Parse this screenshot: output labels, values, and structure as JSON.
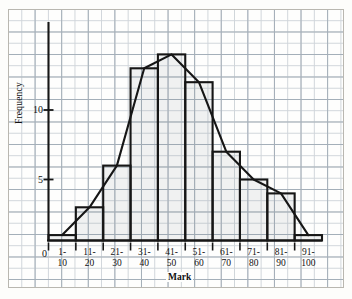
{
  "chart_data": {
    "type": "bar",
    "title": "",
    "subtitle": "",
    "xlabel": "Mark",
    "ylabel": "Frequency",
    "categories": [
      "1-\n10",
      "11-\n20",
      "21-\n30",
      "31-\n40",
      "41-\n50",
      "51-\n60",
      "61-\n70",
      "71-\n80",
      "81-\n90",
      "91-\n100"
    ],
    "category_lines": [
      {
        "top": "1-",
        "bottom": "10"
      },
      {
        "top": "11-",
        "bottom": "20"
      },
      {
        "top": "21-",
        "bottom": "30"
      },
      {
        "top": "31-",
        "bottom": "40"
      },
      {
        "top": "41-",
        "bottom": "50"
      },
      {
        "top": "51-",
        "bottom": "60"
      },
      {
        "top": "61-",
        "bottom": "70"
      },
      {
        "top": "71-",
        "bottom": "80"
      },
      {
        "top": "81-",
        "bottom": "90"
      },
      {
        "top": "91-",
        "bottom": "100"
      }
    ],
    "values": [
      1,
      3,
      6,
      13,
      14,
      12,
      7,
      5,
      4,
      1
    ],
    "series": [
      {
        "name": "Frequency",
        "values": [
          1,
          3,
          6,
          13,
          14,
          12,
          7,
          5,
          4,
          1
        ]
      }
    ],
    "overlay": {
      "type": "line",
      "name": "frequency polygon",
      "points": [
        1,
        3,
        6,
        13,
        14,
        12,
        7,
        5,
        4,
        1
      ]
    },
    "ylim": [
      0,
      16
    ],
    "yticks": [
      5,
      10
    ],
    "ytick_labels": [
      "5",
      "10"
    ],
    "origin_label": "0",
    "grid": true,
    "legend": "none"
  },
  "axes": {
    "y_label": "Frequency",
    "x_label": "Mark",
    "origin": "0",
    "tick_5": "5",
    "tick_10": "10"
  }
}
